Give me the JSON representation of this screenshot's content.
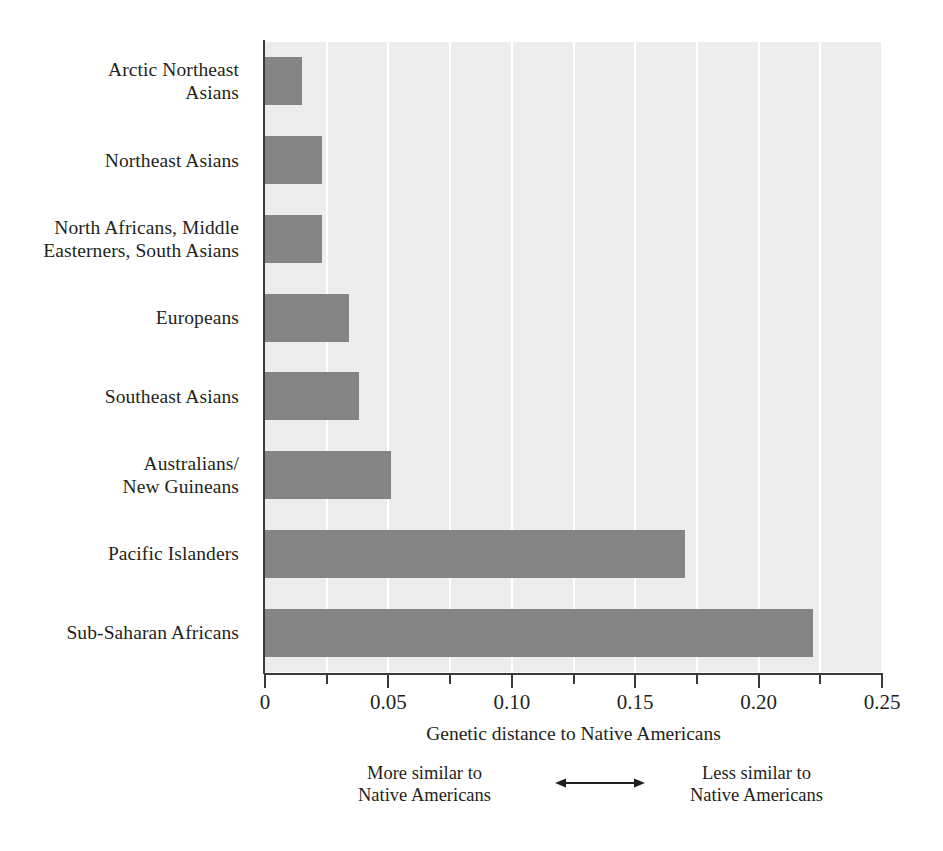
{
  "chart_data": {
    "type": "bar",
    "orientation": "horizontal",
    "title": "",
    "xlabel": "Genetic distance to Native Americans",
    "ylabel": "",
    "xlim": [
      0,
      0.25
    ],
    "grid": "vertical white gridlines every 0.025",
    "legend": "none",
    "categories": [
      "Arctic Northeast\nAsians",
      "Northeast Asians",
      "North Africans, Middle\nEasterners, South Asians",
      "Europeans",
      "Southeast Asians",
      "Australians/\nNew Guineans",
      "Pacific Islanders",
      "Sub-Saharan Africans"
    ],
    "values": [
      0.015,
      0.023,
      0.023,
      0.034,
      0.038,
      0.051,
      0.17,
      0.222
    ],
    "tick_values": [
      0,
      0.025,
      0.05,
      0.075,
      0.1,
      0.125,
      0.15,
      0.175,
      0.2,
      0.225,
      0.25
    ],
    "major_tick_labels": [
      {
        "value": 0,
        "label": "0"
      },
      {
        "value": 0.05,
        "label": "0.05"
      },
      {
        "value": 0.1,
        "label": "0.10"
      },
      {
        "value": 0.15,
        "label": "0.15"
      },
      {
        "value": 0.2,
        "label": "0.20"
      },
      {
        "value": 0.25,
        "label": "0.25"
      }
    ],
    "annotations": {
      "left_text": "More similar to\nNative Americans",
      "right_text": "Less similar to\nNative Americans",
      "arrow": "double-headed horizontal arrow"
    },
    "colors": {
      "bar": "#848484",
      "plot_background": "#ececec",
      "gridline": "#ffffff",
      "axis": "#3a3a3a",
      "text": "#231f20",
      "page_background": "#ffffff"
    }
  }
}
